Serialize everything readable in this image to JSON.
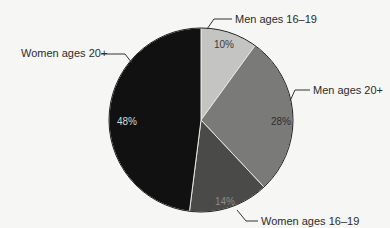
{
  "chart_data": {
    "type": "pie",
    "title": "",
    "slices": [
      {
        "label": "Men ages 16–19",
        "value": 10,
        "pct_label": "10%",
        "color": "#c4c4c2",
        "pct_color": "#3a3a3a"
      },
      {
        "label": "Men ages 20+",
        "value": 28,
        "pct_label": "28%",
        "color": "#7a7a78",
        "pct_color": "#2e2e2e"
      },
      {
        "label": "Women ages 16–19",
        "value": 14,
        "pct_label": "14%",
        "color": "#4a4a48",
        "pct_color": "#8a8a88"
      },
      {
        "label": "Women ages 20+",
        "value": 48,
        "pct_label": "48%",
        "color": "#111111",
        "pct_color": "#d8d8d8"
      }
    ]
  }
}
